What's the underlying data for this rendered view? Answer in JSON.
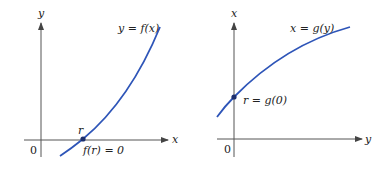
{
  "diagram": {
    "colors": {
      "curve": "#2e55b8",
      "axis": "#555555",
      "point": "#1c2f6e"
    },
    "left_graph": {
      "vertical_axis_label": "y",
      "horizontal_axis_label": "x",
      "origin_label": "0",
      "curve_label": "y = f(x)",
      "point_label": "r",
      "point_annotation": "f(r) = 0"
    },
    "right_graph": {
      "vertical_axis_label": "x",
      "horizontal_axis_label": "y",
      "origin_label": "0",
      "curve_label": "x = g(y)",
      "point_annotation": "r = g(0)"
    }
  }
}
